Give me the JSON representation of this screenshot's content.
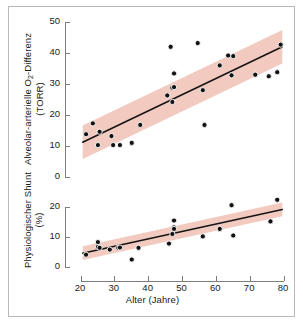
{
  "figure": {
    "background": "#ffffff",
    "frame_color": "#b9b9b9",
    "band_color": "#f3cabf",
    "line_color": "#141414",
    "point_color": "#121212",
    "axis_color": "#7d7d7d"
  },
  "chart_data": [
    {
      "type": "scatter",
      "id": "upper",
      "title": "",
      "xlabel": "",
      "ylabel": "Alveolar-arterielle O2-Differenz (TORR)",
      "ylabel_line1": "Alveolar-arterielle O",
      "ylabel_sub": "2",
      "ylabel_line1b": "-Differenz",
      "ylabel_line2": "(TORR)",
      "xlim": [
        20,
        80
      ],
      "ylim": [
        0,
        50
      ],
      "xticks": [
        20,
        30,
        40,
        50,
        60,
        70,
        80
      ],
      "yticks": [
        0,
        10,
        20,
        30,
        40,
        50
      ],
      "ytick_labels": [
        "0",
        "10",
        "20",
        "30",
        "40",
        "50"
      ],
      "grid": false,
      "legend": "none",
      "x": [
        21.5,
        23.5,
        25.0,
        25.5,
        29.0,
        29.5,
        31.5,
        35.0,
        37.5,
        45.5,
        46.5,
        47.0,
        47.0,
        47.5,
        47.5,
        54.5,
        56.0,
        56.5,
        61.0,
        63.5,
        64.5,
        65.0,
        71.5,
        75.5,
        78.0,
        79.0
      ],
      "y": [
        13.8,
        17.3,
        10.3,
        14.6,
        13.2,
        10.3,
        10.3,
        11.0,
        16.8,
        26.3,
        42.0,
        28.8,
        24.2,
        33.4,
        29.0,
        43.2,
        28.0,
        16.8,
        36.0,
        39.2,
        32.8,
        39.0,
        33.0,
        32.5,
        33.8,
        42.7
      ],
      "fit_line": {
        "x": [
          20.5,
          79.5
        ],
        "y": [
          11.2,
          42.0
        ]
      },
      "band": {
        "half_width": 5.4,
        "note": "confidence band around fit"
      }
    },
    {
      "type": "scatter",
      "id": "lower",
      "title": "",
      "xlabel": "Alter (Jahre)",
      "ylabel": "Physiologischer Shunt (%)",
      "ylabel_line1": "Physiologischer Shunt",
      "ylabel_line2": "(%)",
      "xlim": [
        20,
        80
      ],
      "ylim": [
        0,
        20
      ],
      "xticks": [
        20,
        30,
        40,
        50,
        60,
        70,
        80
      ],
      "xtick_labels": [
        "20",
        "30",
        "40",
        "50",
        "60",
        "70",
        "80"
      ],
      "yticks": [
        0,
        10,
        20
      ],
      "ytick_labels": [
        "0",
        "10",
        "20"
      ],
      "grid": false,
      "legend": "none",
      "x": [
        21.5,
        25.0,
        25.0,
        25.5,
        28.5,
        31.0,
        31.5,
        35.0,
        37.0,
        46.0,
        47.0,
        47.5,
        47.5,
        47.5,
        56.0,
        61.0,
        64.5,
        65.0,
        76.0,
        78.0
      ],
      "y": [
        4.1,
        8.3,
        6.7,
        6.4,
        5.8,
        6.4,
        6.5,
        2.5,
        6.4,
        7.8,
        11.0,
        13.2,
        12.7,
        15.5,
        10.2,
        12.7,
        20.6,
        10.5,
        15.2,
        22.4
      ],
      "fit_line": {
        "x": [
          20.5,
          79.5
        ],
        "y": [
          4.6,
          19.2
        ]
      },
      "band": {
        "half_width": 2.3,
        "note": "confidence band around fit"
      }
    }
  ]
}
